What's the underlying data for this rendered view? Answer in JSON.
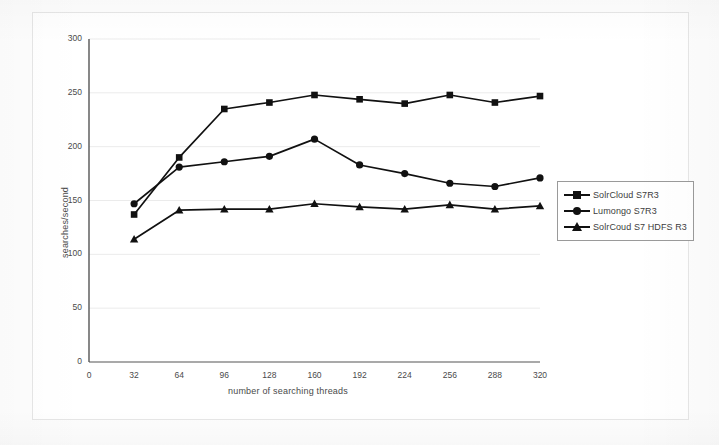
{
  "chart_data": {
    "type": "line",
    "title": "",
    "xlabel": "number of searching threads",
    "ylabel": "searches/second",
    "x": [
      32,
      64,
      96,
      128,
      160,
      192,
      224,
      256,
      288,
      320
    ],
    "xticks": [
      "0",
      "32",
      "64",
      "96",
      "128",
      "160",
      "192",
      "224",
      "256",
      "288",
      "320"
    ],
    "yticks": [
      "0",
      "50",
      "100",
      "150",
      "200",
      "250",
      "300"
    ],
    "xlim": [
      0,
      320
    ],
    "ylim": [
      0,
      300
    ],
    "grid": "horizontal",
    "legend_position": "right",
    "series": [
      {
        "name": "SolrCloud S7R3",
        "marker": "square",
        "color": "#111111",
        "values": [
          137,
          190,
          235,
          241,
          248,
          244,
          240,
          248,
          241,
          247
        ]
      },
      {
        "name": "Lumongo S7R3",
        "marker": "circle",
        "color": "#111111",
        "values": [
          147,
          181,
          186,
          191,
          207,
          183,
          175,
          166,
          163,
          171
        ]
      },
      {
        "name": "SolrCoud S7 HDFS R3",
        "marker": "triangle",
        "color": "#111111",
        "values": [
          114,
          141,
          142,
          142,
          147,
          144,
          142,
          146,
          142,
          145
        ]
      }
    ]
  },
  "axes": {
    "ylabel": "searches/second",
    "xlabel": "number of searching threads"
  },
  "legend": {
    "items": [
      {
        "label": "SolrCloud S7R3",
        "marker": "square"
      },
      {
        "label": "Lumongo S7R3",
        "marker": "circle"
      },
      {
        "label": "SolrCoud S7 HDFS R3",
        "marker": "triangle"
      }
    ]
  },
  "colors": {
    "series": "#111111",
    "axis": "#555555",
    "grid": "#ebebeb",
    "frame": "#e6e6e6",
    "text": "#3d3d3d"
  }
}
